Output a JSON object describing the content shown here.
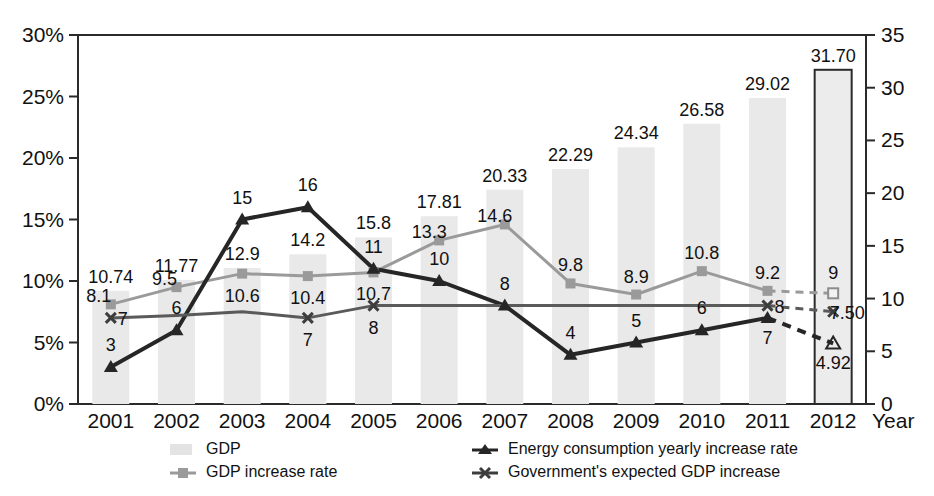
{
  "chart_data": {
    "type": "bar",
    "title": "",
    "subtitle": "",
    "xlabel": "Year",
    "ylabel": "",
    "categories": [
      "2001",
      "2002",
      "2003",
      "2004",
      "2005",
      "2006",
      "2007",
      "2008",
      "2009",
      "2010",
      "2011",
      "2012"
    ],
    "left_axis": {
      "label": "",
      "ticks": [
        "0%",
        "5%",
        "10%",
        "15%",
        "20%",
        "25%",
        "30%"
      ],
      "tick_values": [
        0,
        5,
        10,
        15,
        20,
        25,
        30
      ],
      "ylim": [
        0,
        30
      ],
      "unit": "%"
    },
    "right_axis": {
      "label": "",
      "ticks": [
        "0",
        "5",
        "10",
        "15",
        "20",
        "25",
        "30",
        "35"
      ],
      "tick_values": [
        0,
        5,
        10,
        15,
        20,
        25,
        30,
        35
      ],
      "ylim": [
        0,
        35
      ]
    },
    "grid": false,
    "legend_position": "bottom",
    "series": [
      {
        "name": "GDP",
        "type": "bar",
        "axis": "right",
        "marker": "bar-swatch",
        "color": "#e9e9e9",
        "values": [
          10.74,
          11.77,
          12.9,
          14.2,
          15.8,
          17.81,
          20.33,
          22.29,
          24.34,
          26.58,
          29.02,
          31.7
        ],
        "labels": [
          "10.74",
          "11.77",
          "12.9",
          "14.2",
          "15.8",
          "17.81",
          "20.33",
          "22.29",
          "24.34",
          "26.58",
          "29.02",
          "31.70"
        ],
        "projected_index": 11
      },
      {
        "name": "GDP increase rate",
        "type": "line",
        "axis": "left",
        "marker": "square",
        "color": "#9a9a9a",
        "values": [
          8.1,
          9.5,
          10.6,
          10.4,
          10.7,
          13.3,
          14.6,
          9.8,
          8.9,
          10.8,
          9.2,
          9
        ],
        "labels": [
          "8.1",
          "9.5",
          "10.6",
          "10.4",
          "10.7",
          "13.3",
          "14.6",
          "9.8",
          "8.9",
          "10.8",
          "9.2",
          "9"
        ],
        "projected_index": 11
      },
      {
        "name": "Energy consumption yearly increase rate",
        "type": "line",
        "axis": "left",
        "marker": "triangle",
        "color": "#262626",
        "values": [
          3,
          6,
          15,
          16,
          11,
          10,
          8,
          4,
          5,
          6,
          7,
          4.92
        ],
        "labels": [
          "3",
          "6",
          "15",
          "16",
          "11",
          "10",
          "8",
          "4",
          "5",
          "6",
          "7",
          "4.92"
        ],
        "projected_index": 11
      },
      {
        "name": "Government's expected GDP increase",
        "type": "line",
        "axis": "left",
        "marker": "x",
        "color": "#5a5a5a",
        "values": [
          7,
          7.2,
          7.5,
          7,
          8,
          8,
          8,
          8,
          8,
          8,
          8,
          7.5
        ],
        "labels": [
          "7",
          "",
          "",
          "7",
          "8",
          "",
          "",
          "",
          "",
          "",
          "8",
          "7.50"
        ],
        "projected_index": 11
      }
    ],
    "legend": [
      {
        "label": "GDP",
        "marker": "bar-swatch",
        "color": "#e3e3e3"
      },
      {
        "label": "Energy consumption yearly increase rate",
        "marker": "triangle",
        "color": "#262626"
      },
      {
        "label": "GDP increase rate",
        "marker": "square",
        "color": "#9a9a9a"
      },
      {
        "label": "Government's expected GDP increase",
        "marker": "x",
        "color": "#3d3d3d"
      }
    ]
  }
}
